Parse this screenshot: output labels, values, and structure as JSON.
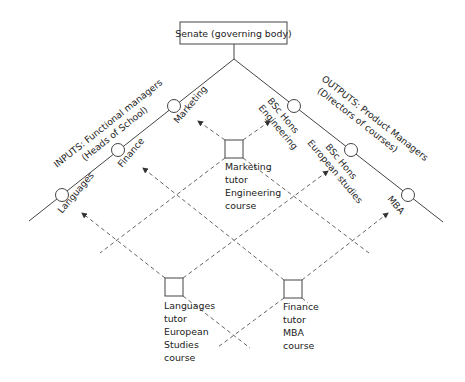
{
  "senate": {
    "label": "Senate (governing body)"
  },
  "inputs_heading": {
    "line1": "INPUTS: Functional managers",
    "line2": "(Heads of School)"
  },
  "outputs_heading": {
    "line1": "OUTPUTS: Product Managers",
    "line2": "(Directors of courses)"
  },
  "input_nodes": [
    {
      "id": "languages",
      "label": "Languages"
    },
    {
      "id": "finance",
      "label": "Finance"
    },
    {
      "id": "marketing",
      "label": "Marketing"
    }
  ],
  "output_nodes": [
    {
      "id": "bsc-eng",
      "line1": "BSc Hons",
      "line2": "Engineering"
    },
    {
      "id": "bsc-eur",
      "line1": "BSc Hons",
      "line2": "European studies"
    },
    {
      "id": "mba",
      "line1": "MBA",
      "line2": ""
    }
  ],
  "tutors": [
    {
      "id": "marketing-tutor",
      "lines": [
        "Marketing",
        "tutor",
        "Engineering",
        "course"
      ],
      "reports_to": [
        "marketing",
        "bsc-eng"
      ]
    },
    {
      "id": "languages-tutor",
      "lines": [
        "Languages",
        "tutor",
        "European",
        "Studies",
        "course"
      ],
      "reports_to": [
        "languages",
        "bsc-eur"
      ]
    },
    {
      "id": "finance-tutor",
      "lines": [
        "Finance",
        "tutor",
        "MBA",
        "course"
      ],
      "reports_to": [
        "finance",
        "mba"
      ]
    }
  ]
}
